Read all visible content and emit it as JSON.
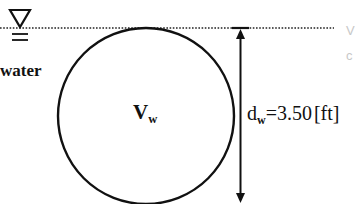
{
  "diagram": {
    "type": "tank-cross-section",
    "water_surface": {
      "symbol": "water-surface-triangle-icon",
      "line_style": "dotted",
      "label": "water"
    },
    "tank": {
      "shape": "circle",
      "volume_label": "V",
      "volume_subscript": "w"
    },
    "depth_dimension": {
      "symbol": "d",
      "subscript": "w",
      "equals": "=",
      "value": "3.50",
      "unit": "[ft]"
    },
    "clipped_text": [
      "V",
      "c"
    ],
    "colors": {
      "stroke": "#111111",
      "background": "#ffffff",
      "faint_text": "#c8c8c8"
    }
  }
}
